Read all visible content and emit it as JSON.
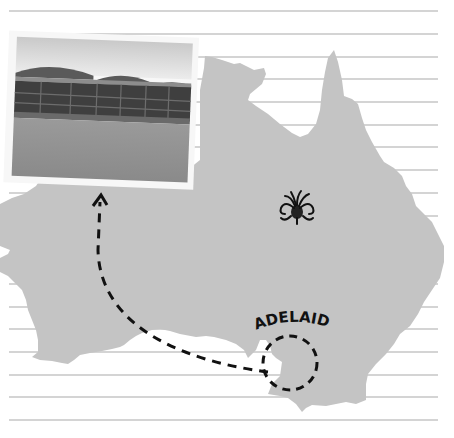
{
  "infographic": {
    "background_color": "#ffffff",
    "ruled_lines": {
      "color": "#a9a9a9",
      "count": 19,
      "start_y": 11,
      "spacing": 22.7,
      "x1": 9,
      "x2": 438
    },
    "map": {
      "name": "Australia",
      "fill_color": "#c4c4c4"
    },
    "photo": {
      "subject": "cricket-stadium-grandstands",
      "frame_color": "#f7f7f7"
    },
    "decorative_icon": "waratah-flower-icon",
    "city_label": "ADELAIDE",
    "route": {
      "style": "dashed",
      "color": "#111111",
      "from": "adelaide-circle",
      "to": "photo"
    }
  }
}
